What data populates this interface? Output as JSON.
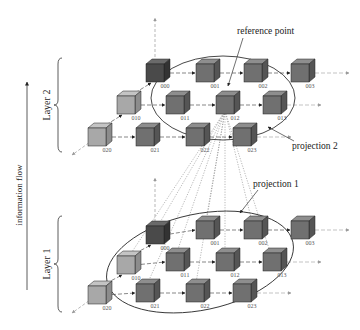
{
  "diagram": {
    "axis_label": "information flow",
    "annotations": {
      "reference_point": "reference point",
      "projection_1": "projection 1",
      "projection_2": "projection 2"
    },
    "layers": [
      {
        "id": "layer2",
        "label": "Layer 2",
        "brace": {
          "x": 58,
          "y1": 58,
          "y2": 152
        },
        "label_pos": {
          "x": 50,
          "y": 105
        },
        "ellipse": {
          "cx": 223,
          "cy": 98,
          "rx": 72,
          "ry": 42,
          "rot": 0
        },
        "axis_up": {
          "x": 155,
          "y1": 62,
          "y2": 18
        },
        "axis_diag": {
          "x1": 97,
          "y1": 137,
          "x2": 72,
          "y2": 155
        },
        "cubes": [
          {
            "id": "000",
            "x": 155,
            "y": 73,
            "shade": "dark"
          },
          {
            "id": "001",
            "x": 205,
            "y": 73,
            "shade": "mid"
          },
          {
            "id": "002",
            "x": 253,
            "y": 73,
            "shade": "mid"
          },
          {
            "id": "003",
            "x": 300,
            "y": 73,
            "shade": "mid"
          },
          {
            "id": "010",
            "x": 126,
            "y": 105,
            "shade": "light"
          },
          {
            "id": "011",
            "x": 175,
            "y": 105,
            "shade": "mid"
          },
          {
            "id": "012",
            "x": 225,
            "y": 105,
            "shade": "mid"
          },
          {
            "id": "013",
            "x": 272,
            "y": 105,
            "shade": "mid"
          },
          {
            "id": "020",
            "x": 97,
            "y": 137,
            "shade": "light"
          },
          {
            "id": "021",
            "x": 145,
            "y": 137,
            "shade": "mid"
          },
          {
            "id": "022",
            "x": 195,
            "y": 137,
            "shade": "mid"
          },
          {
            "id": "023",
            "x": 242,
            "y": 137,
            "shade": "mid"
          }
        ]
      },
      {
        "id": "layer1",
        "label": "Layer 1",
        "brace": {
          "x": 58,
          "y1": 216,
          "y2": 312
        },
        "label_pos": {
          "x": 50,
          "y": 264
        },
        "ellipse": {
          "cx": 200,
          "cy": 262,
          "rx": 95,
          "ry": 48,
          "rot": -12
        },
        "axis_up": {
          "x": 155,
          "y1": 222,
          "y2": 178
        },
        "axis_diag": {
          "x1": 97,
          "y1": 295,
          "x2": 72,
          "y2": 313
        },
        "cubes": [
          {
            "id": "000",
            "x": 155,
            "y": 235,
            "shade": "dark"
          },
          {
            "id": "001",
            "x": 205,
            "y": 230,
            "shade": "mid"
          },
          {
            "id": "002",
            "x": 253,
            "y": 230,
            "shade": "mid"
          },
          {
            "id": "003",
            "x": 300,
            "y": 230,
            "shade": "mid"
          },
          {
            "id": "010",
            "x": 126,
            "y": 265,
            "shade": "light"
          },
          {
            "id": "011",
            "x": 175,
            "y": 262,
            "shade": "mid"
          },
          {
            "id": "012",
            "x": 225,
            "y": 262,
            "shade": "mid"
          },
          {
            "id": "013",
            "x": 272,
            "y": 262,
            "shade": "mid"
          },
          {
            "id": "020",
            "x": 97,
            "y": 295,
            "shade": "light"
          },
          {
            "id": "021",
            "x": 145,
            "y": 293,
            "shade": "mid"
          },
          {
            "id": "022",
            "x": 195,
            "y": 293,
            "shade": "mid"
          },
          {
            "id": "023",
            "x": 242,
            "y": 293,
            "shade": "mid"
          }
        ]
      }
    ],
    "reference_cube": {
      "layer": "layer2",
      "id": "012"
    },
    "projection_targets_layer1": [
      "000",
      "001",
      "002",
      "010",
      "011",
      "012",
      "013",
      "021",
      "022"
    ],
    "shades": {
      "dark": {
        "front": "#4a4a4a",
        "top": "#6a6a6a",
        "side": "#333333"
      },
      "mid": {
        "front": "#707070",
        "top": "#8e8e8e",
        "side": "#555555"
      },
      "light": {
        "front": "#a8a8a8",
        "top": "#c4c4c4",
        "side": "#8c8c8c"
      }
    },
    "text_positions": {
      "reference_point": {
        "x": 237,
        "y": 34
      },
      "projection_2": {
        "x": 292,
        "y": 149
      },
      "projection_1": {
        "x": 253,
        "y": 187
      },
      "axis_label": {
        "x": 22,
        "y": 195
      }
    }
  }
}
